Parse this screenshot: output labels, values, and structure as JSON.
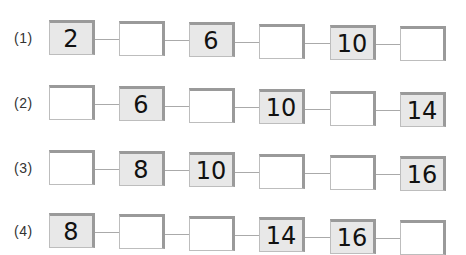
{
  "rows": [
    {
      "label": "(1)",
      "top": 20,
      "skew": 6,
      "cells": [
        {
          "value": "2",
          "given": true
        },
        {
          "value": "",
          "given": false
        },
        {
          "value": "6",
          "given": true
        },
        {
          "value": "",
          "given": false
        },
        {
          "value": "10",
          "given": true
        },
        {
          "value": "",
          "given": false
        }
      ]
    },
    {
      "label": "(2)",
      "top": 85,
      "skew": 7,
      "cells": [
        {
          "value": "",
          "given": false
        },
        {
          "value": "6",
          "given": true
        },
        {
          "value": "",
          "given": false
        },
        {
          "value": "10",
          "given": true
        },
        {
          "value": "",
          "given": false
        },
        {
          "value": "14",
          "given": true
        }
      ]
    },
    {
      "label": "(3)",
      "top": 150,
      "skew": 6,
      "cells": [
        {
          "value": "",
          "given": false
        },
        {
          "value": "8",
          "given": true
        },
        {
          "value": "10",
          "given": true
        },
        {
          "value": "",
          "given": false
        },
        {
          "value": "",
          "given": false
        },
        {
          "value": "16",
          "given": true
        }
      ]
    },
    {
      "label": "(4)",
      "top": 213,
      "skew": 7,
      "cells": [
        {
          "value": "8",
          "given": true
        },
        {
          "value": "",
          "given": false
        },
        {
          "value": "",
          "given": false
        },
        {
          "value": "14",
          "given": true
        },
        {
          "value": "16",
          "given": true
        },
        {
          "value": "",
          "given": false
        }
      ]
    }
  ],
  "layout": {
    "box_x": [
      49,
      119,
      189,
      259,
      330,
      400
    ],
    "box_w": 46,
    "box_h": 35
  },
  "colors": {
    "given_fill": "#e8e8e8",
    "blank_fill": "#ffffff",
    "border_dark": "#9a9a9a",
    "border_light": "#bdbdbd",
    "connector": "#aaaaaa"
  }
}
